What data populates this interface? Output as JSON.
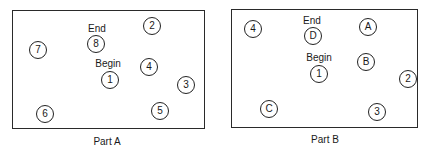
{
  "panels": [
    {
      "caption": "Part A",
      "box": {
        "x": 12,
        "y": 10,
        "w": 193,
        "h": 119
      },
      "caption_pos": {
        "x": 107,
        "y": 141
      },
      "labels": [
        {
          "text": "End",
          "x": 97,
          "y": 28
        },
        {
          "text": "Begin",
          "x": 108,
          "y": 63
        }
      ],
      "nodes": [
        {
          "text": "2",
          "x": 152,
          "y": 26
        },
        {
          "text": "8",
          "x": 96,
          "y": 44
        },
        {
          "text": "7",
          "x": 38,
          "y": 50
        },
        {
          "text": "4",
          "x": 149,
          "y": 67
        },
        {
          "text": "1",
          "x": 110,
          "y": 80
        },
        {
          "text": "3",
          "x": 186,
          "y": 85
        },
        {
          "text": "5",
          "x": 160,
          "y": 111
        },
        {
          "text": "6",
          "x": 45,
          "y": 114
        }
      ]
    },
    {
      "caption": "Part B",
      "box": {
        "x": 231,
        "y": 9,
        "w": 187,
        "h": 119
      },
      "caption_pos": {
        "x": 325,
        "y": 139
      },
      "labels": [
        {
          "text": "End",
          "x": 312,
          "y": 20
        },
        {
          "text": "Begin",
          "x": 319,
          "y": 57
        }
      ],
      "nodes": [
        {
          "text": "4",
          "x": 253,
          "y": 29
        },
        {
          "text": "D",
          "x": 313,
          "y": 36
        },
        {
          "text": "A",
          "x": 368,
          "y": 27
        },
        {
          "text": "B",
          "x": 366,
          "y": 62
        },
        {
          "text": "1",
          "x": 319,
          "y": 74
        },
        {
          "text": "2",
          "x": 408,
          "y": 79
        },
        {
          "text": "C",
          "x": 269,
          "y": 109
        },
        {
          "text": "3",
          "x": 377,
          "y": 112
        }
      ]
    }
  ]
}
